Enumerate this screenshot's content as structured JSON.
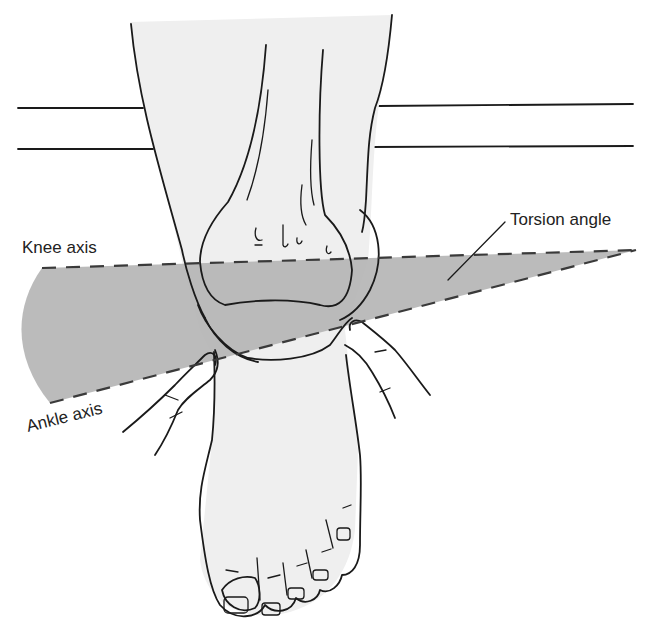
{
  "figure": {
    "type": "anatomical diagram"
  },
  "labels": {
    "knee_axis": "Knee axis",
    "ankle_axis": "Ankle axis",
    "torsion_angle": "Torsion angle"
  },
  "colors": {
    "background": "#ffffff",
    "skin_fill": "#efefef",
    "angle_fill": "#b4b4b4",
    "line": "#1a1a1a",
    "dash": "#3a3a3a",
    "text": "#222222"
  }
}
